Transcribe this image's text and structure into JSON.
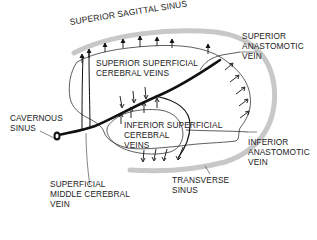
{
  "diagram": {
    "type": "anatomical-diagram",
    "colors": {
      "sinus": "#c8c8c8",
      "vein": "#111111",
      "outline": "#333333",
      "text": "#222222",
      "background": "#ffffff"
    },
    "labels": {
      "superior_sagittal_sinus": "SUPERIOR SAGITTAL SINUS",
      "superior_anastomotic_vein": "SUPERIOR\nANASTOMOTIC\nVEIN",
      "superior_superficial_cerebral_veins": "SUPERIOR SUPERFICIAL\nCEREBRAL VEINS",
      "cavernous_sinus": "CAVERNOUS\nSINUS",
      "inferior_superficial_cerebral_veins": "INFERIOR SUPERFICIAL\nCEREBRAL\nVEINS",
      "inferior_anastomotic_vein": "INFERIOR\nANASTOMOTIC\nVEIN",
      "transverse_sinus": "TRANSVERSE\nSINUS",
      "superficial_middle_cerebral_vein": "SUPERFICIAL\nMIDDLE CEREBRAL\nVEIN"
    }
  }
}
